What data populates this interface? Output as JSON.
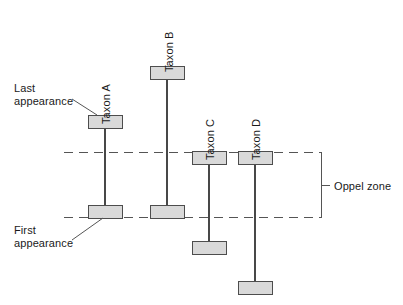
{
  "diagram": {
    "colors": {
      "box_fill": "#d9d9d9",
      "box_stroke": "#4d4d4d",
      "range_line": "#1a1a1a",
      "dashed_line": "#555555",
      "bracket": "#555555",
      "leader": "#555555",
      "text": "#1a1a1a",
      "background": "#ffffff"
    },
    "annotations": {
      "last_appearance": "Last\nappearance",
      "last_appearance_line1": "Last",
      "last_appearance_line2": "appearance",
      "first_appearance": "First\nappearance",
      "first_appearance_line1": "First",
      "first_appearance_line2": "appearance",
      "oppel_zone": "Oppel zone"
    },
    "taxa": [
      {
        "id": "taxon-a",
        "label": "Taxon A",
        "label_x": 112,
        "label_y": 112,
        "box_x": 88,
        "box_width": 34,
        "box_height": 13,
        "top_box_y": 115,
        "bottom_box_y": 205,
        "line_x": 105
      },
      {
        "id": "taxon-b",
        "label": "Taxon B",
        "label_x": 175,
        "label_y": 60,
        "box_x": 150,
        "box_width": 34,
        "box_height": 13,
        "top_box_y": 67,
        "bottom_box_y": 205,
        "line_x": 167
      },
      {
        "id": "taxon-c",
        "label": "Taxon C",
        "label_x": 216,
        "label_y": 148,
        "box_x": 192,
        "box_width": 34,
        "box_height": 13,
        "top_box_y": 152,
        "bottom_box_y": 241,
        "line_x": 209
      },
      {
        "id": "taxon-d",
        "label": "Taxon D",
        "label_x": 262,
        "label_y": 148,
        "box_x": 238,
        "box_width": 34,
        "box_height": 13,
        "top_box_y": 152,
        "bottom_box_y": 281,
        "line_x": 255
      }
    ],
    "zone_boundaries": {
      "upper_dashed_y": 152,
      "lower_dashed_y": 217,
      "dashed_x_start": 64,
      "dashed_x_end": 321
    },
    "bracket": {
      "x": 321,
      "top_y": 152,
      "bottom_y": 217,
      "tick_y": 185,
      "tick_x_end": 330,
      "label_x": 334,
      "label_y": 185
    }
  }
}
